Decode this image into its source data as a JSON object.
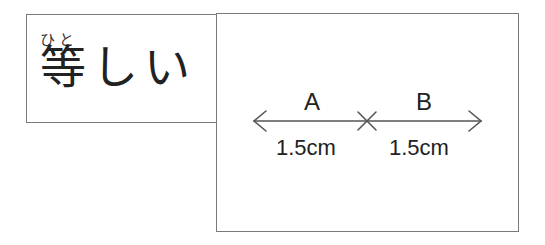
{
  "vocab": {
    "furigana": "ひと",
    "word": "等しい"
  },
  "diagram": {
    "segments": [
      {
        "label": "A",
        "length": "1.5cm"
      },
      {
        "label": "B",
        "length": "1.5cm"
      }
    ],
    "line_color": "#555555"
  }
}
